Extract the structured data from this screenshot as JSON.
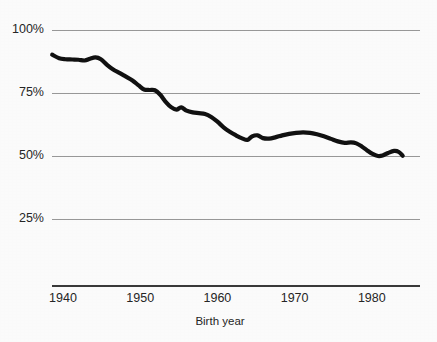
{
  "chart_data": {
    "type": "line",
    "title": "",
    "subtitle": "",
    "xlabel": "Birth year",
    "ylabel": "",
    "xlim": [
      1938.5,
      1986.0
    ],
    "ylim": [
      0,
      100
    ],
    "grid": true,
    "legend": false,
    "legend_position": "none",
    "line_color": "#111111",
    "grid_color": "#8d8d8d",
    "axis_color": "#3a3a3a",
    "background_color": "#fbfbfb",
    "x_ticks": [
      {
        "value": 1940,
        "label": "1940"
      },
      {
        "value": 1950,
        "label": "1950"
      },
      {
        "value": 1960,
        "label": "1960"
      },
      {
        "value": 1970,
        "label": "1970"
      },
      {
        "value": 1980,
        "label": "1980"
      }
    ],
    "y_ticks": [
      {
        "value": 100,
        "label": "100%"
      },
      {
        "value": 75,
        "label": "75%"
      },
      {
        "value": 50,
        "label": "50%"
      },
      {
        "value": 25,
        "label": "25%"
      }
    ],
    "x": [
      1938.6,
      1939.5,
      1940.3,
      1941.2,
      1942.0,
      1942.8,
      1943.5,
      1944.2,
      1944.9,
      1945.7,
      1946.5,
      1947.3,
      1948.1,
      1949.0,
      1949.8,
      1950.5,
      1951.2,
      1951.9,
      1952.6,
      1953.3,
      1954.0,
      1954.7,
      1955.3,
      1956.0,
      1956.8,
      1957.6,
      1958.4,
      1959.2,
      1960.0,
      1960.8,
      1961.6,
      1962.4,
      1963.2,
      1963.9,
      1964.5,
      1965.2,
      1965.9,
      1966.7,
      1967.5,
      1968.4,
      1969.3,
      1970.2,
      1971.1,
      1972.0,
      1972.9,
      1973.8,
      1974.7,
      1975.6,
      1976.5,
      1977.3,
      1978.0,
      1978.7,
      1979.4,
      1980.1,
      1980.8,
      1981.4,
      1982.1,
      1982.9,
      1983.5,
      1984.0
    ],
    "y": [
      90.2,
      88.8,
      88.4,
      88.3,
      88.2,
      87.9,
      88.6,
      89.1,
      88.4,
      86.2,
      84.3,
      83.0,
      81.6,
      80.0,
      78.0,
      76.4,
      76.2,
      76.1,
      74.3,
      71.5,
      69.4,
      68.4,
      69.3,
      68.0,
      67.3,
      67.0,
      66.7,
      65.5,
      63.6,
      61.4,
      59.6,
      58.2,
      57.0,
      56.4,
      57.8,
      58.2,
      57.1,
      56.9,
      57.4,
      58.2,
      58.8,
      59.2,
      59.4,
      59.2,
      58.6,
      57.8,
      56.8,
      55.8,
      55.2,
      55.4,
      55.0,
      53.8,
      52.2,
      50.8,
      50.0,
      50.2,
      51.2,
      52.0,
      51.6,
      50.1
    ],
    "series_name": "share"
  }
}
